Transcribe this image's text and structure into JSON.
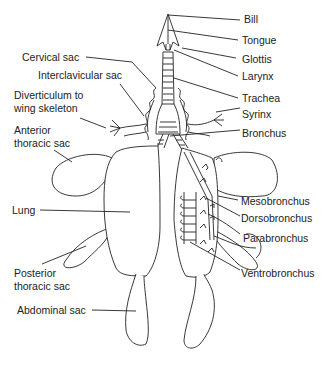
{
  "figure": {
    "line_color": "#222222",
    "background": "#ffffff"
  },
  "labels": {
    "bill": "Bill",
    "tongue": "Tongue",
    "glottis": "Glottis",
    "larynx": "Larynx",
    "trachea": "Trachea",
    "syrinx": "Syrinx",
    "bronchus": "Bronchus",
    "cervical_sac": "Cervical sac",
    "interclavicular_sac": "Interclavicular sac",
    "diverticulum_line1": "Diverticulum to",
    "diverticulum_line2": "wing skeleton",
    "anterior_line1": "Anterior",
    "anterior_line2": "thoracic sac",
    "lung": "Lung",
    "posterior_line1": "Posterior",
    "posterior_line2": "thoracic sac",
    "abdominal_sac": "Abdominal sac",
    "mesobronchus": "Mesobronchus",
    "dorsobronchus": "Dorsobronchus",
    "parabronchus": "Parabronchus",
    "ventrobronchus": "Ventrobronchus"
  }
}
